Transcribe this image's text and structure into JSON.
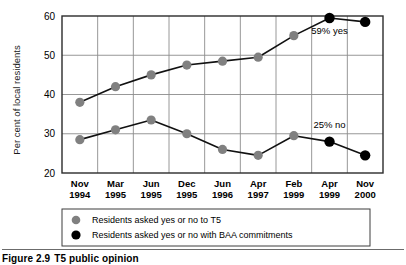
{
  "figure": {
    "caption_number": "Figure 2.9",
    "caption_text": "T5 public opinion"
  },
  "chart_data": {
    "type": "line",
    "title": "",
    "xlabel": "",
    "ylabel": "Per cent of local residents",
    "ylim": [
      20,
      60
    ],
    "yticks": [
      20,
      30,
      40,
      50,
      60
    ],
    "ytick_labels": [
      "20",
      "30",
      "40",
      "50",
      "60"
    ],
    "grid": true,
    "legend_position": "below",
    "categories": [
      "Nov 1994",
      "Mar 1995",
      "Jun 1995",
      "Dec 1995",
      "Jun 1996",
      "Apr 1997",
      "Feb 1999",
      "Apr 1999",
      "Nov 2000"
    ],
    "category_lines": [
      {
        "month": "Nov",
        "year": "1994"
      },
      {
        "month": "Mar",
        "year": "1995"
      },
      {
        "month": "Jun",
        "year": "1995"
      },
      {
        "month": "Dec",
        "year": "1995"
      },
      {
        "month": "Jun",
        "year": "1996"
      },
      {
        "month": "Apr",
        "year": "1997"
      },
      {
        "month": "Feb",
        "year": "1999"
      },
      {
        "month": "Apr",
        "year": "1999"
      },
      {
        "month": "Nov",
        "year": "2000"
      }
    ],
    "series": [
      {
        "name": "Residents asked yes or no to T5",
        "marker": "filled-circle",
        "color": "#808080",
        "subseries": "yes",
        "values": [
          38,
          42,
          45,
          47.5,
          48.5,
          49.5,
          55,
          null,
          null
        ]
      },
      {
        "name": "Residents asked yes or no to T5",
        "marker": "filled-circle",
        "color": "#808080",
        "subseries": "no",
        "values": [
          28.5,
          31,
          33.5,
          30,
          26,
          24.5,
          29.5,
          null,
          null
        ]
      },
      {
        "name": "Residents asked yes or no with BAA commitments",
        "marker": "filled-circle",
        "color": "#000000",
        "subseries": "yes",
        "values": [
          null,
          null,
          null,
          null,
          null,
          null,
          null,
          59.5,
          58.5
        ]
      },
      {
        "name": "Residents asked yes or no with BAA commitments",
        "marker": "filled-circle",
        "color": "#000000",
        "subseries": "no",
        "values": [
          null,
          null,
          null,
          null,
          null,
          null,
          null,
          28,
          24.5
        ]
      }
    ],
    "annotations": [
      {
        "text": "59% yes",
        "x_category": "Apr 1999",
        "y": 55.5
      },
      {
        "text": "25% no",
        "x_category": "Apr 1999",
        "y": 31.5
      }
    ]
  },
  "legend": {
    "items": [
      {
        "label": "Residents asked yes or no to T5",
        "color": "#808080"
      },
      {
        "label": "Residents asked yes or no with BAA commitments",
        "color": "#000000"
      }
    ]
  }
}
